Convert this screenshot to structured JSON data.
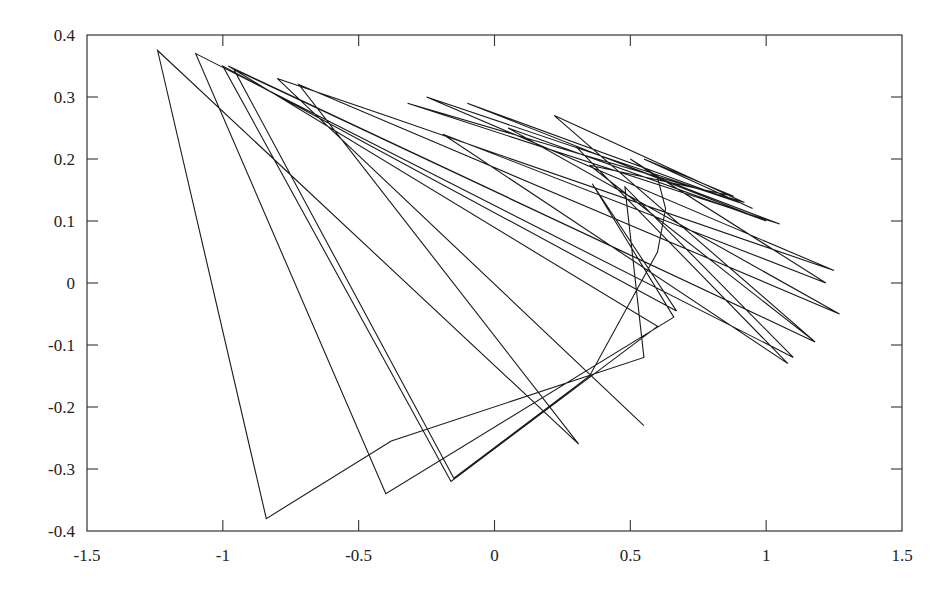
{
  "chart_data": {
    "type": "line",
    "title": "",
    "xlabel": "",
    "ylabel": "",
    "xlim": [
      -1.5,
      1.5
    ],
    "ylim": [
      -0.4,
      0.4
    ],
    "grid": false,
    "legend": null,
    "x_ticks": [
      -1.5,
      -1,
      -0.5,
      0,
      0.5,
      1,
      1.5
    ],
    "x_tick_labels": [
      "-1.5",
      "-1",
      "-0.5",
      "0",
      "0.5",
      "1",
      "1.5"
    ],
    "y_ticks": [
      0.4,
      0.3,
      0.2,
      0.1,
      0,
      -0.1,
      -0.2,
      -0.3,
      -0.4
    ],
    "y_tick_labels": [
      "0.4",
      "0.3",
      "0.2",
      "0.1",
      "0",
      "-0.1",
      "-0.2",
      "-0.3",
      "-0.4"
    ],
    "line_color": "#1a1a1a",
    "series": [
      {
        "name": "trajectory",
        "points": [
          [
            0.55,
            -0.23
          ],
          [
            -0.8,
            0.33
          ],
          [
            -0.4,
            0.27
          ],
          [
            1.25,
            0.02
          ],
          [
            -0.25,
            0.3
          ],
          [
            0.9,
            0.13
          ],
          [
            -0.1,
            0.29
          ],
          [
            1.0,
            0.1
          ],
          [
            0.05,
            0.25
          ],
          [
            1.27,
            -0.05
          ],
          [
            -0.72,
            0.32
          ],
          [
            0.31,
            -0.26
          ],
          [
            -1.24,
            0.375
          ],
          [
            -0.84,
            -0.38
          ],
          [
            -0.38,
            -0.255
          ],
          [
            0.55,
            -0.12
          ],
          [
            0.48,
            0.155
          ],
          [
            1.1,
            -0.12
          ],
          [
            -1.1,
            0.37
          ],
          [
            -0.4,
            -0.34
          ],
          [
            0.66,
            -0.055
          ],
          [
            0.36,
            0.16
          ],
          [
            0.67,
            -0.045
          ],
          [
            -1.0,
            0.35
          ],
          [
            -0.16,
            -0.32
          ],
          [
            0.6,
            -0.07
          ],
          [
            -0.98,
            0.35
          ],
          [
            1.18,
            -0.095
          ],
          [
            0.22,
            0.27
          ],
          [
            0.92,
            0.13
          ],
          [
            -0.32,
            0.29
          ],
          [
            1.05,
            0.095
          ],
          [
            0.3,
            0.22
          ],
          [
            1.08,
            -0.13
          ],
          [
            -0.19,
            0.24
          ],
          [
            1.22,
            0.0
          ],
          [
            0.5,
            0.2
          ],
          [
            0.6,
            0.17
          ],
          [
            0.63,
            0.12
          ],
          [
            0.6,
            0.05
          ],
          [
            0.35,
            -0.15
          ],
          [
            -0.15,
            -0.315
          ],
          [
            -0.96,
            0.345
          ],
          [
            1.18,
            -0.095
          ],
          [
            0.35,
            0.19
          ],
          [
            0.88,
            0.14
          ],
          [
            0.55,
            0.2
          ],
          [
            0.95,
            0.12
          ]
        ]
      }
    ]
  }
}
